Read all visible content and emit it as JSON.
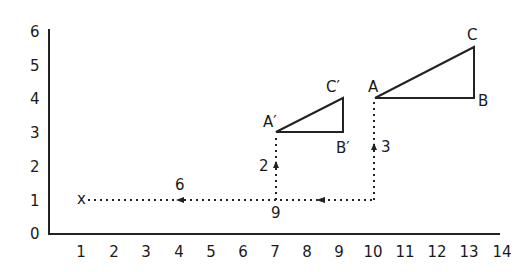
{
  "diagram": {
    "type": "translation-on-grid",
    "x_axis": {
      "ticks": [
        "1",
        "2",
        "3",
        "4",
        "5",
        "6",
        "7",
        "8",
        "9",
        "10",
        "11",
        "12",
        "13",
        "14"
      ],
      "range": [
        0,
        14
      ]
    },
    "y_axis": {
      "ticks": [
        "0",
        "1",
        "2",
        "3",
        "4",
        "5",
        "6"
      ],
      "range": [
        0,
        6
      ]
    },
    "origin_label": "0",
    "start_marker": {
      "label": "x",
      "x": 1,
      "y": 1
    },
    "triangle_ABC": {
      "A": {
        "label": "A",
        "x": 10,
        "y": 4
      },
      "B": {
        "label": "B",
        "x": 13,
        "y": 4
      },
      "C": {
        "label": "C",
        "x": 13,
        "y": 5.5
      }
    },
    "triangle_A1B1C1": {
      "A": {
        "label": "A′",
        "x": 7,
        "y": 3
      },
      "B": {
        "label": "B′",
        "x": 9,
        "y": 3
      },
      "C": {
        "label": "C′",
        "x": 9,
        "y": 4
      }
    },
    "path_labels": {
      "horizontal_6": "6",
      "horizontal_9": "9",
      "vertical_2": "2",
      "vertical_3": "3"
    }
  }
}
